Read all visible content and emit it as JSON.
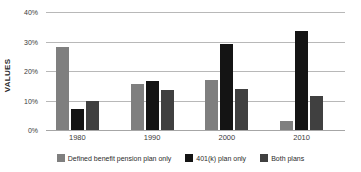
{
  "chart_data": {
    "type": "bar",
    "title": "",
    "xlabel": "",
    "ylabel": "VALUES",
    "categories": [
      "1980",
      "1990",
      "2000",
      "2010"
    ],
    "series": [
      {
        "name": "Defined benefit pension plan only",
        "color": "#7f7f7f",
        "values": [
          28,
          15.5,
          17,
          3
        ]
      },
      {
        "name": "401(k) plan only",
        "color": "#141414",
        "values": [
          7,
          16.5,
          29,
          33.5
        ]
      },
      {
        "name": "Both plans",
        "color": "#404040",
        "values": [
          10,
          13.5,
          14,
          11.5
        ]
      }
    ],
    "ylim": [
      0,
      40
    ],
    "ytick_values": [
      0,
      10,
      20,
      30,
      40
    ],
    "ytick_labels": [
      "0%",
      "10%",
      "20%",
      "30%",
      "40%"
    ],
    "grid": true,
    "legend_position": "bottom",
    "value_suffix": "%"
  }
}
